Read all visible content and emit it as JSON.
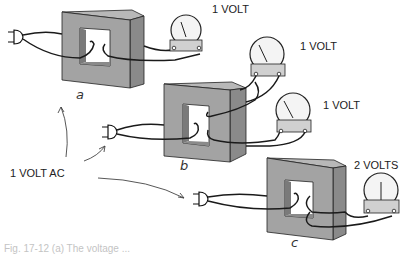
{
  "diagram": {
    "source_label": "1 VOLT AC",
    "panels": [
      {
        "id": "a",
        "letter": "a",
        "meter_labels": [
          "1 VOLT"
        ],
        "primary_turns": 1,
        "secondary_turns": 1
      },
      {
        "id": "b",
        "letter": "b",
        "meter_labels": [
          "1 VOLT",
          "1 VOLT"
        ],
        "primary_turns": 1,
        "secondary_turns": 1,
        "secondaries": 2
      },
      {
        "id": "c",
        "letter": "c",
        "meter_labels": [
          "2 VOLTS"
        ],
        "primary_turns": 1,
        "secondary_turns": 2
      }
    ],
    "caption": "Fig. 17-12 (a) The voltage ..."
  },
  "colors": {
    "core_front": "#a3a3a3",
    "core_side": "#8a8a8a",
    "core_top": "#b8b8b8",
    "core_window": "#7a7a7a",
    "wire": "#1a1a1a",
    "meter_face": "#f4f4f4",
    "meter_base": "#d0d0d0"
  }
}
